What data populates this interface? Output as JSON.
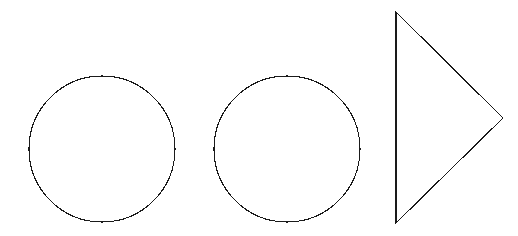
{
  "figure": {
    "width": 518,
    "height": 236,
    "background_color": "#ffffff",
    "stroke_color": "#1a1a1a",
    "stroke_width": 1,
    "fill": "none",
    "rendering": "aliased 1-pixel black outlines on white background",
    "shape_count": 3
  },
  "shapes": [
    {
      "id": "circle-left",
      "type": "circle",
      "label": "Circle",
      "center_x": 102,
      "center_y": 149,
      "radius": 73,
      "bbox": {
        "left": 29,
        "top": 76,
        "right": 176,
        "bottom": 222
      }
    },
    {
      "id": "circle-middle",
      "type": "circle",
      "label": "Circle",
      "center_x": 287,
      "center_y": 149,
      "radius": 73,
      "bbox": {
        "left": 214,
        "top": 76,
        "right": 360,
        "bottom": 222
      }
    },
    {
      "id": "triangle-right",
      "type": "triangle",
      "label": "Triangle",
      "orientation": "pointing-right",
      "points": "396,12 396,223 503,118",
      "vertices": [
        {
          "x": 396,
          "y": 12
        },
        {
          "x": 396,
          "y": 223
        },
        {
          "x": 503,
          "y": 118
        }
      ],
      "bbox": {
        "left": 396,
        "top": 12,
        "right": 503,
        "bottom": 223
      }
    }
  ]
}
